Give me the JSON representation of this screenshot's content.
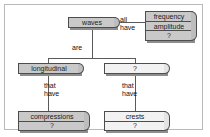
{
  "diagram": {
    "type": "concept-map",
    "colors": {
      "node_fill": "#c9c9c9",
      "node_fill_light": "#f2f2f2",
      "node_border": "#4d4d4d",
      "shadow": "#8e8e8e",
      "connector": "#5a5a5a",
      "frame": "#b9b9b9",
      "background": "#ffffff",
      "text": "#1c1c1c"
    },
    "nodes": [
      {
        "id": "waves",
        "label": "waves",
        "style": "dark",
        "rows": [
          "waves"
        ]
      },
      {
        "id": "properties",
        "label": "frequency",
        "style": "dark",
        "rows": [
          "frequency",
          "amplitude",
          "?"
        ]
      },
      {
        "id": "longitudinal",
        "label": "longitudinal",
        "style": "dark",
        "rows": [
          "longitudinal"
        ]
      },
      {
        "id": "transverse",
        "label": "?",
        "style": "light",
        "rows": [
          "?"
        ]
      },
      {
        "id": "compressions",
        "label": "compressions",
        "style": "dark",
        "rows": [
          "compressions",
          "?"
        ]
      },
      {
        "id": "crests",
        "label": "crests",
        "style": "light",
        "rows": [
          "crests",
          "?"
        ]
      }
    ],
    "node_rows": {
      "waves": {
        "row1": "waves"
      },
      "properties": {
        "row1": "frequency",
        "row2": "amplitude",
        "row3": "?"
      },
      "longitudinal": {
        "row1": "longitudinal"
      },
      "transverse": {
        "row1": "?"
      },
      "compressions": {
        "row1": "compressions",
        "row2": "?"
      },
      "crests": {
        "row1": "crests",
        "row2": "?"
      }
    },
    "edge_labels": {
      "all_have": "all\nhave",
      "all_have_line1": "all",
      "all_have_line2": "have",
      "are": "are",
      "that_have_left_line1": "that",
      "that_have_left_line2": "have",
      "that_have_right_line1": "that",
      "that_have_right_line2": "have"
    },
    "edges": [
      {
        "from": "waves",
        "to": "properties",
        "label": "all have"
      },
      {
        "from": "waves",
        "to": "longitudinal",
        "label": "are"
      },
      {
        "from": "waves",
        "to": "transverse",
        "label": "are"
      },
      {
        "from": "longitudinal",
        "to": "compressions",
        "label": "that have"
      },
      {
        "from": "transverse",
        "to": "crests",
        "label": "that have"
      }
    ]
  }
}
